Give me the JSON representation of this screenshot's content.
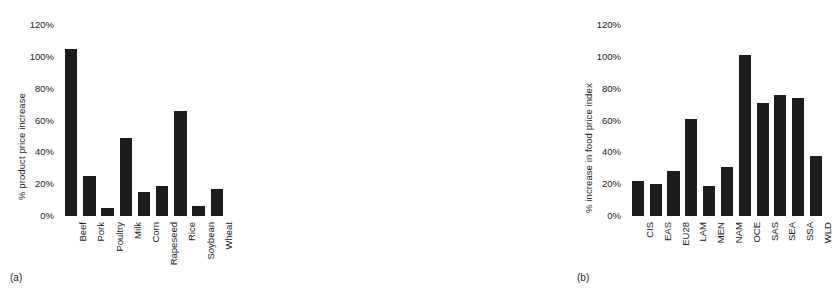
{
  "chart_data": [
    {
      "type": "bar",
      "panel": "(a)",
      "title": "",
      "xlabel": "",
      "ylabel": "% product price increase",
      "ylim": [
        0,
        120
      ],
      "yticks": [
        120,
        100,
        80,
        60,
        40,
        20,
        0
      ],
      "ytick_labels": [
        "120%",
        "100%",
        "80%",
        "60%",
        "40%",
        "20%",
        "0%"
      ],
      "grid": false,
      "legend": false,
      "bar_color": "#1c1c1c",
      "categories": [
        "Beef",
        "Pork",
        "Poultry",
        "Milk",
        "Corn",
        "Rapeseed",
        "Rice",
        "Soybean",
        "Wheat"
      ],
      "values": [
        105,
        25,
        5,
        49,
        15,
        19,
        66,
        6,
        17
      ]
    },
    {
      "type": "bar",
      "panel": "(b)",
      "title": "",
      "xlabel": "",
      "ylabel": "% increase in food price index",
      "ylim": [
        0,
        120
      ],
      "yticks": [
        120,
        100,
        80,
        60,
        40,
        20,
        0
      ],
      "ytick_labels": [
        "120%",
        "100%",
        "80%",
        "60%",
        "40%",
        "20%",
        "0%"
      ],
      "grid": false,
      "legend": false,
      "bar_color": "#1c1c1c",
      "categories": [
        "CIS",
        "EAS",
        "EU28",
        "LAM",
        "MEN",
        "NAM",
        "OCE",
        "SAS",
        "SEA",
        "SSA",
        "WLD"
      ],
      "values": [
        22,
        20,
        28,
        61,
        19,
        31,
        101,
        71,
        76,
        74,
        38
      ]
    }
  ],
  "panel_a": {
    "caption": "(a)",
    "ylabel": "% product price increase",
    "yticks": [
      "120%",
      "100%",
      "80%",
      "60%",
      "40%",
      "20%",
      "0%"
    ],
    "categories": [
      "Beef",
      "Pork",
      "Poultry",
      "Milk",
      "Corn",
      "Rapeseed",
      "Rice",
      "Soybean",
      "Wheat"
    ]
  },
  "panel_b": {
    "caption": "(b)",
    "ylabel": "% increase in food price index",
    "yticks": [
      "120%",
      "100%",
      "80%",
      "60%",
      "40%",
      "20%",
      "0%"
    ],
    "categories": [
      "CIS",
      "EAS",
      "EU28",
      "LAM",
      "MEN",
      "NAM",
      "OCE",
      "SAS",
      "SEA",
      "SSA",
      "WLD"
    ]
  }
}
